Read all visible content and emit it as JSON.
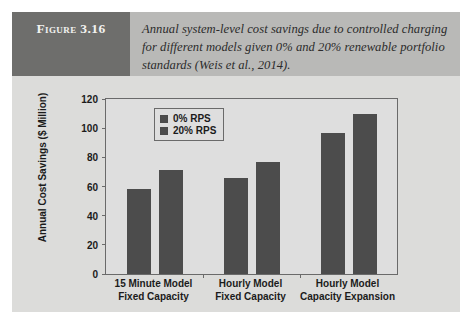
{
  "figure": {
    "number_label": "Figure 3.16",
    "caption": "Annual system-level cost savings due to controlled charging for different models given 0% and 20% renewable portfolio standards (Weis et al., 2014).",
    "header_block_color": "#6e6e6c",
    "header_band_color": "#b9b9b7",
    "page_background": "#dcdcda"
  },
  "chart_data": {
    "type": "bar",
    "title": "",
    "xlabel": "",
    "ylabel": "Annual Cost Savings ($ Million)",
    "ylim": [
      0,
      120
    ],
    "yticks": [
      0,
      20,
      40,
      60,
      80,
      100,
      120
    ],
    "ytick_labels": [
      "0",
      "20",
      "40",
      "60",
      "80",
      "100",
      "120"
    ],
    "grid": false,
    "legend_position": "upper-left-inside",
    "categories": [
      "15 Minute Model Fixed Capacity",
      "Hourly Model Fixed Capacity",
      "Hourly Model Capacity Expansion"
    ],
    "category_lines": [
      [
        "15 Minute Model",
        "Fixed Capacity"
      ],
      [
        "Hourly Model",
        "Fixed Capacity"
      ],
      [
        "Hourly Model",
        "Capacity Expansion"
      ]
    ],
    "series": [
      {
        "name": "0% RPS",
        "color": "#4c4c4c",
        "values": [
          58.5,
          66,
          97
        ]
      },
      {
        "name": "20% RPS",
        "color": "#4c4c4c",
        "values": [
          71.5,
          76.5,
          110
        ]
      }
    ],
    "plot_background": "#dedede",
    "axis_color": "#6a6a6a"
  }
}
